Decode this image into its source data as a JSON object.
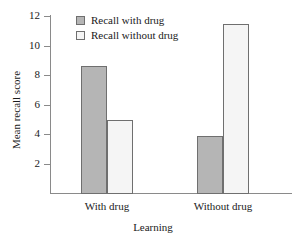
{
  "chart_data": {
    "type": "bar",
    "title": "",
    "xlabel": "Learning",
    "ylabel": "Mean recall score",
    "categories": [
      "With drug",
      "Without drug"
    ],
    "series": [
      {
        "name": "Recall with drug",
        "values": [
          8.7,
          3.9
        ],
        "color": "#b5b5b5"
      },
      {
        "name": "Recall without drug",
        "values": [
          5.0,
          11.5
        ],
        "color": "#f5f5f5"
      }
    ],
    "ylim": [
      0,
      12
    ],
    "yticks": [
      2,
      4,
      6,
      8,
      10,
      12
    ],
    "ytick_labels": [
      "2",
      "4",
      "6",
      "8",
      "10",
      "12"
    ],
    "grid": false,
    "legend_position": "top-center",
    "bar_border_color": "#6f6f6f",
    "axis_color": "#8a8a8a"
  },
  "legend": {
    "entries": [
      {
        "label": "Recall with drug"
      },
      {
        "label": "Recall without drug"
      }
    ]
  },
  "axes": {
    "y_title": "Mean recall score",
    "x_title": "Learning",
    "x_categories": [
      "With drug",
      "Without drug"
    ],
    "y_ticks": [
      "2",
      "4",
      "6",
      "8",
      "10",
      "12"
    ]
  }
}
